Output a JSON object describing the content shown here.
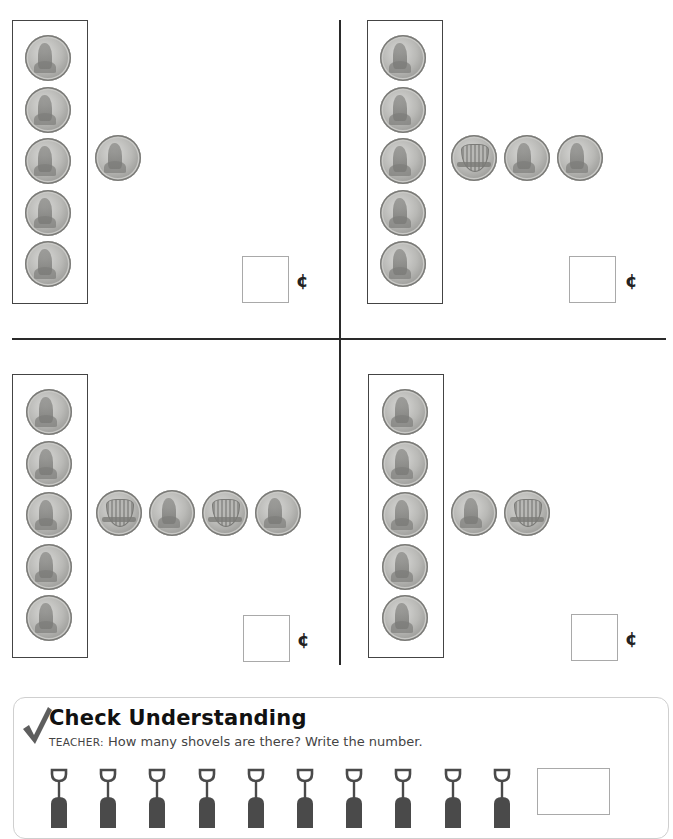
{
  "worksheet": {
    "currency_symbol": "¢",
    "panels": [
      {
        "id": "top-left",
        "framed_pennies": 5,
        "extra_coins": [
          "head"
        ],
        "answer": ""
      },
      {
        "id": "top-right",
        "framed_pennies": 5,
        "extra_coins": [
          "shield",
          "head",
          "head"
        ],
        "answer": ""
      },
      {
        "id": "bottom-left",
        "framed_pennies": 5,
        "extra_coins": [
          "shield",
          "head",
          "shield",
          "head"
        ],
        "answer": ""
      },
      {
        "id": "bottom-right",
        "framed_pennies": 5,
        "extra_coins": [
          "head",
          "shield"
        ],
        "answer": ""
      }
    ]
  },
  "check_understanding": {
    "title": "Check Understanding",
    "teacher_label": "TEACHER:",
    "prompt": "How many shovels are there? Write the number.",
    "shovel_count": 10,
    "answer": ""
  },
  "colors": {
    "frame_border": "#444444",
    "divider": "#2a2a2a",
    "answer_box_border": "#a9a9a9",
    "checkmark": "#5e5e5e",
    "shovel": "#4a4a4a"
  }
}
